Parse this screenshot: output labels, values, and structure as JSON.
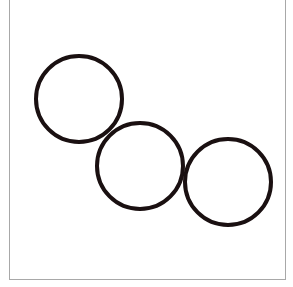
{
  "figure": {
    "frame_color": "#a8a8a8",
    "stroke_color": "#1a1011",
    "stroke_width": 4,
    "circles": [
      {
        "id": "circle-1",
        "cx": 79,
        "cy": 99,
        "r": 43
      },
      {
        "id": "circle-2",
        "cx": 140,
        "cy": 166,
        "r": 43
      },
      {
        "id": "circle-3",
        "cx": 228,
        "cy": 182,
        "r": 43
      }
    ]
  }
}
